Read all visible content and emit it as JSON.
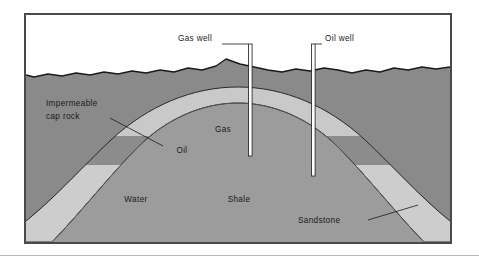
{
  "figure": {
    "frame_color": "#4a4a4a",
    "background_color": "#ffffff"
  },
  "labels": {
    "gas_well": "Gas well",
    "oil_well": "Oil well",
    "impermeable_line1": "Impermeable",
    "impermeable_line2": "cap rock",
    "gas": "Gas",
    "oil": "Oil",
    "water": "Water",
    "shale": "Shale",
    "sandstone": "Sandstone"
  },
  "layers": [
    {
      "name": "sky",
      "label": "",
      "color": "#ffffff",
      "description": "Air above ground surface"
    },
    {
      "name": "overburden",
      "label": "",
      "color": "#8a8a8a",
      "description": "Gray rock above the impermeable cap rock"
    },
    {
      "name": "cap-rock",
      "label": "Impermeable cap rock",
      "color": "#3d3d3d",
      "description": "Dark impermeable seal arching over the anticline"
    },
    {
      "name": "gas-cap",
      "label": "Gas",
      "color": "#c9c9c9",
      "description": "Light gas accumulation at crest of anticline"
    },
    {
      "name": "oil-zone",
      "label": "Oil",
      "color": "#8c8c8c",
      "description": "Oil band beneath the gas cap"
    },
    {
      "name": "water-sandstone",
      "label": "Water / Sandstone",
      "color": "#cdcdcd",
      "description": "Water saturated sandstone reservoir on the flanks"
    },
    {
      "name": "shale-core",
      "label": "Shale",
      "color": "#9c9c9c",
      "description": "Shale forming the core of the anticline"
    }
  ],
  "wells": [
    {
      "name": "gas-well",
      "label": "Gas well",
      "casing_color": "#ffffff",
      "outline_color": "#1a1a1a",
      "target_layer": "Gas",
      "x": 224,
      "top_y": 42,
      "bottom_y": 141
    },
    {
      "name": "oil-well",
      "label": "Oil well",
      "casing_color": "#ffffff",
      "outline_color": "#1a1a1a",
      "target_layer": "Oil",
      "x": 287,
      "top_y": 42,
      "bottom_y": 161
    }
  ],
  "colors": {
    "ink": "#1a1a1a",
    "frame": "#4a4a4a",
    "overburden": "#8a8a8a",
    "cap_rock": "#3d3d3d",
    "gas": "#c9c9c9",
    "oil": "#8c8c8c",
    "water_sandstone": "#cdcdcd",
    "shale": "#9c9c9c",
    "rule": "#b8b8b8"
  }
}
